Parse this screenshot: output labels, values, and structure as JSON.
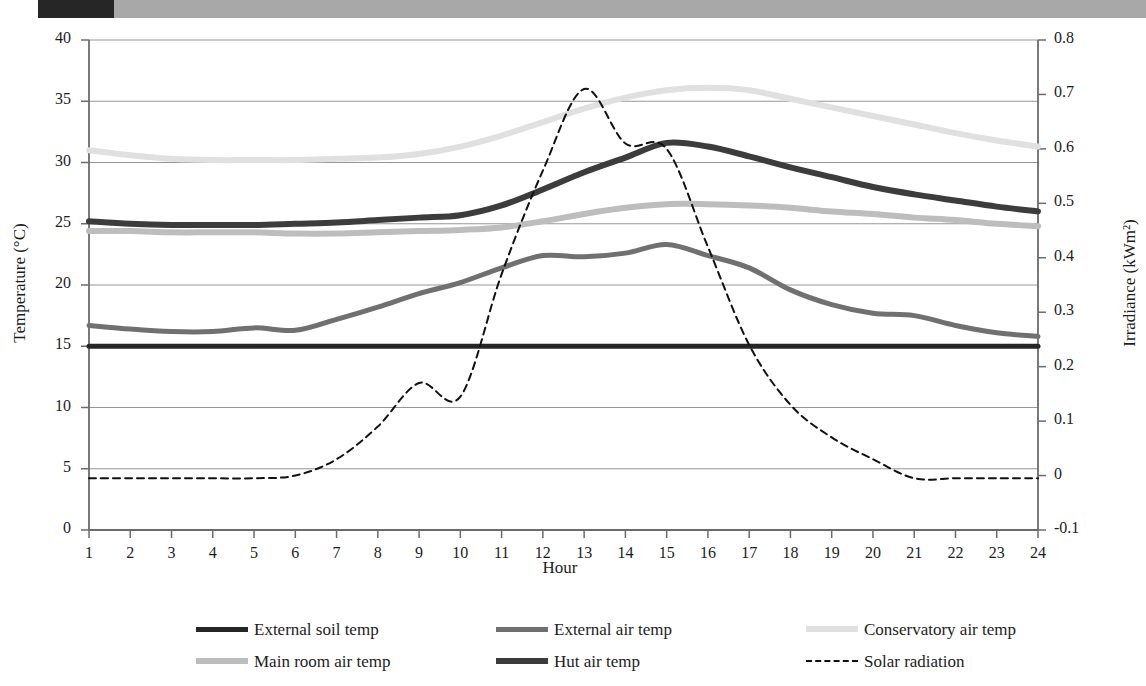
{
  "header": {
    "page_number": "",
    "title": "",
    "block_color": "#262626",
    "bar_color": "#a8a8a8"
  },
  "chart_data": {
    "type": "line",
    "title": "",
    "xlabel": "Hour",
    "ylabel": "Temperature (°C)",
    "y2label": "Irradiance (kWm²)",
    "x": [
      1,
      2,
      3,
      4,
      5,
      6,
      7,
      8,
      9,
      10,
      11,
      12,
      13,
      14,
      15,
      16,
      17,
      18,
      19,
      20,
      21,
      22,
      23,
      24
    ],
    "xtick_labels": [
      "1",
      "2",
      "3",
      "4",
      "5",
      "6",
      "7",
      "8",
      "9",
      "10",
      "11",
      "12",
      "13",
      "14",
      "15",
      "16",
      "17",
      "18",
      "19",
      "20",
      "21",
      "22",
      "23",
      "24"
    ],
    "ylim": [
      0,
      40
    ],
    "ytick_labels": [
      "0",
      "5",
      "10",
      "15",
      "20",
      "25",
      "30",
      "35",
      "40"
    ],
    "ytick_values": [
      0,
      5,
      10,
      15,
      20,
      25,
      30,
      35,
      40
    ],
    "y2lim": [
      -0.1,
      0.8
    ],
    "y2tick_labels": [
      "-0.1",
      "0",
      "0.1",
      "0.2",
      "0.3",
      "0.4",
      "0.5",
      "0.6",
      "0.7",
      "0.8"
    ],
    "y2tick_values": [
      -0.1,
      0,
      0.1,
      0.2,
      0.3,
      0.4,
      0.5,
      0.6,
      0.7,
      0.8
    ],
    "grid": true,
    "grid_axis": "y",
    "legend_position": "bottom",
    "series": [
      {
        "name": "External soil temp",
        "axis": "left",
        "color": "#262626",
        "width": 5,
        "style": "solid",
        "values": [
          15.0,
          15.0,
          15.0,
          15.0,
          15.0,
          15.0,
          15.0,
          15.0,
          15.0,
          15.0,
          15.0,
          15.0,
          15.0,
          15.0,
          15.0,
          15.0,
          15.0,
          15.0,
          15.0,
          15.0,
          15.0,
          15.0,
          15.0,
          15.0
        ]
      },
      {
        "name": "External air temp",
        "axis": "left",
        "color": "#707070",
        "width": 5,
        "style": "solid",
        "values": [
          16.7,
          16.4,
          16.2,
          16.2,
          16.5,
          16.3,
          17.2,
          18.2,
          19.3,
          20.2,
          21.4,
          22.4,
          22.3,
          22.6,
          23.3,
          22.4,
          21.4,
          19.6,
          18.4,
          17.7,
          17.5,
          16.7,
          16.1,
          15.8
        ]
      },
      {
        "name": "Conservatory air temp",
        "axis": "left",
        "color": "#e0e0e0",
        "width": 6,
        "style": "solid",
        "values": [
          31.0,
          30.6,
          30.3,
          30.2,
          30.2,
          30.2,
          30.3,
          30.4,
          30.7,
          31.3,
          32.2,
          33.3,
          34.4,
          35.3,
          35.9,
          36.1,
          35.9,
          35.2,
          34.5,
          33.8,
          33.1,
          32.4,
          31.8,
          31.3
        ]
      },
      {
        "name": "Main room air temp",
        "axis": "left",
        "color": "#bdbdbd",
        "width": 6,
        "style": "solid",
        "values": [
          24.4,
          24.4,
          24.3,
          24.3,
          24.3,
          24.2,
          24.2,
          24.3,
          24.4,
          24.5,
          24.7,
          25.2,
          25.8,
          26.3,
          26.6,
          26.6,
          26.5,
          26.3,
          26.0,
          25.8,
          25.5,
          25.3,
          25.0,
          24.8
        ]
      },
      {
        "name": "Hut air temp",
        "axis": "left",
        "color": "#3c3c3c",
        "width": 6,
        "style": "solid",
        "values": [
          25.2,
          25.0,
          24.9,
          24.9,
          24.9,
          25.0,
          25.1,
          25.3,
          25.5,
          25.7,
          26.5,
          27.8,
          29.2,
          30.4,
          31.6,
          31.3,
          30.5,
          29.6,
          28.8,
          28.0,
          27.4,
          26.9,
          26.4,
          26.0
        ]
      },
      {
        "name": "Solar radiation",
        "axis": "right",
        "color": "#111111",
        "width": 2,
        "style": "dashed",
        "values": [
          -0.005,
          -0.005,
          -0.005,
          -0.005,
          -0.005,
          0.0,
          0.03,
          0.09,
          0.17,
          0.145,
          0.37,
          0.56,
          0.71,
          0.61,
          0.6,
          0.42,
          0.24,
          0.13,
          0.07,
          0.03,
          -0.005,
          -0.005,
          -0.005,
          -0.005
        ]
      }
    ]
  },
  "legend": {
    "rows": [
      [
        {
          "label": "External soil temp",
          "color": "#262626",
          "style": "solid",
          "thick": false
        },
        {
          "label": "External air temp",
          "color": "#707070",
          "style": "solid",
          "thick": false
        },
        {
          "label": "Conservatory air temp",
          "color": "#e0e0e0",
          "style": "solid",
          "thick": true
        }
      ],
      [
        {
          "label": "Main room air temp",
          "color": "#bdbdbd",
          "style": "solid",
          "thick": true
        },
        {
          "label": "Hut air temp",
          "color": "#3c3c3c",
          "style": "solid",
          "thick": true
        },
        {
          "label": "Solar radiation",
          "color": "#111111",
          "style": "dashed",
          "thick": false
        }
      ]
    ]
  }
}
